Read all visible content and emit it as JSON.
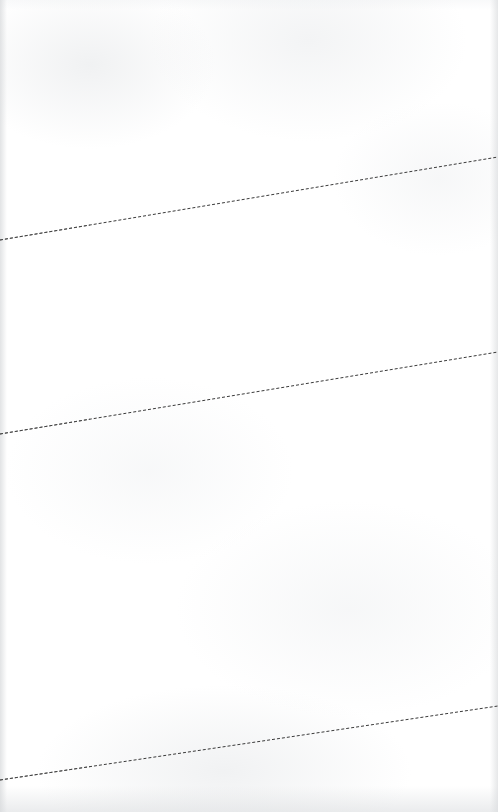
{
  "page": {
    "width": 498,
    "height": 812,
    "background_color": "#fefefe",
    "paper_tone": "#ffffff",
    "edge_shadow_color": "#d8dadc",
    "content_text": "",
    "has_text": false,
    "has_icons": false
  },
  "rules": {
    "count": 3,
    "stroke_color": "#3a3a3a",
    "stroke_width_px": 1,
    "dash_length_px": 3,
    "gap_length_px": 2,
    "style": "dashed",
    "orientation": "diagonal-rising-left-to-right",
    "items": [
      {
        "id": "rule-1",
        "label": "Dashed rule 1",
        "x1": 0,
        "y1": 240,
        "x2": 498,
        "y2": 157,
        "slope_degrees": -9.5
      },
      {
        "id": "rule-2",
        "label": "Dashed rule 2",
        "x1": 0,
        "y1": 434,
        "x2": 498,
        "y2": 352,
        "slope_degrees": -9.4
      },
      {
        "id": "rule-3",
        "label": "Dashed rule 3",
        "x1": 0,
        "y1": 780,
        "x2": 498,
        "y2": 706,
        "slope_degrees": -8.5
      }
    ]
  }
}
